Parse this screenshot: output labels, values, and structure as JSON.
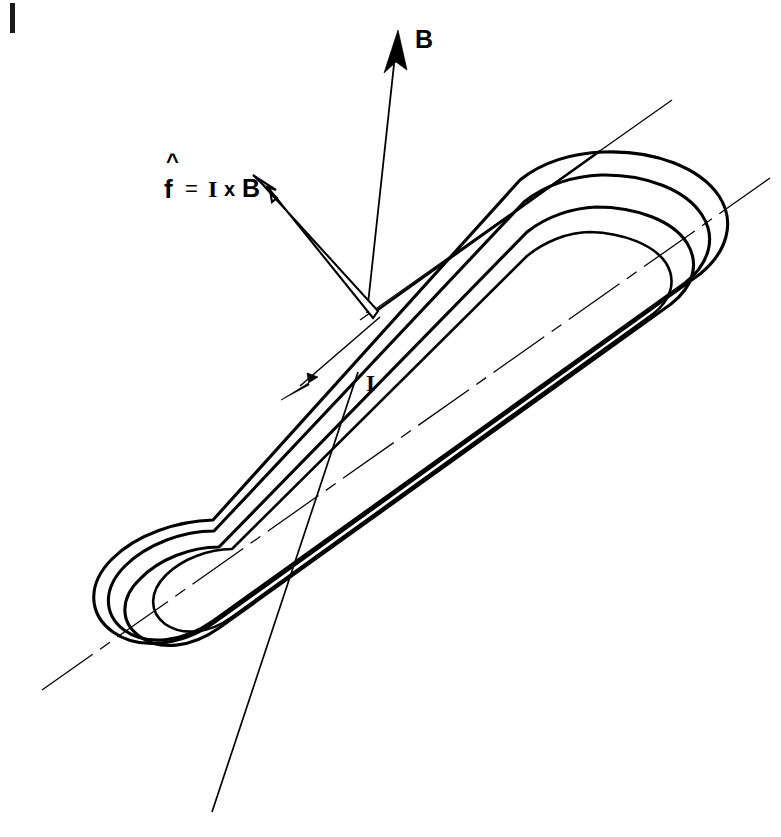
{
  "figure": {
    "background_color": "#ffffff",
    "line_color": "#000000",
    "width": 781,
    "height": 837
  },
  "labels": {
    "magnetic_field": "B",
    "current": "I",
    "formula": {
      "hat": "^",
      "symbol": "f",
      "equals": "=",
      "current": "I",
      "cross": "x",
      "field": "B",
      "full": "f = I x B"
    }
  },
  "vectors": [
    {
      "name": "magnetic-field-vector",
      "label": "B",
      "style": "thin-line-solid-head",
      "from": [
        367,
        313
      ],
      "to": [
        398,
        33
      ]
    },
    {
      "name": "force-vector",
      "label": "f = I x B",
      "style": "hollow-outline-arrow",
      "from": [
        368,
        314
      ],
      "to": [
        253,
        175
      ]
    },
    {
      "name": "current-direction-arrow",
      "label": "I",
      "style": "thin-line-solid-head",
      "from": [
        378,
        318
      ],
      "to": [
        283,
        399
      ]
    }
  ],
  "annotations": {
    "current_leader": {
      "from": [
        358,
        372
      ],
      "to": [
        212,
        812
      ]
    },
    "coil_axis": {
      "from": [
        42,
        690
      ],
      "to": [
        770,
        178
      ],
      "style": "dash-dot-centerline"
    },
    "page_tick": {
      "x": 10,
      "y": 3,
      "width": 5,
      "height": 30
    }
  },
  "geometry": {
    "shape": "racetrack-stadium-loop",
    "rotation_deg": -38,
    "outline_count": 4,
    "description": "Toroidal/racetrack coil drawn in perspective with nested outlines"
  }
}
